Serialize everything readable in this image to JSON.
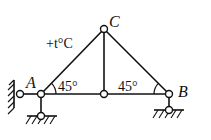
{
  "diagram": {
    "type": "truss",
    "labels": {
      "A": "A",
      "B": "B",
      "C": "C",
      "temperature": "+t°C",
      "angle_left": "45°",
      "angle_right": "45°"
    },
    "nodes": {
      "A": [
        41,
        94
      ],
      "C": [
        104,
        29
      ],
      "M": [
        104,
        94
      ],
      "B": [
        169,
        94
      ],
      "A_horiz_pin": [
        20,
        94
      ],
      "A_vert_pin": [
        41,
        116
      ],
      "B_vert_pin": [
        169,
        110
      ]
    },
    "members": [
      [
        "A",
        "C"
      ],
      [
        "C",
        "B"
      ],
      [
        "A",
        "M"
      ],
      [
        "M",
        "B"
      ],
      [
        "C",
        "M"
      ]
    ],
    "colors": {
      "line": "#111111",
      "background": "#ffffff"
    }
  }
}
